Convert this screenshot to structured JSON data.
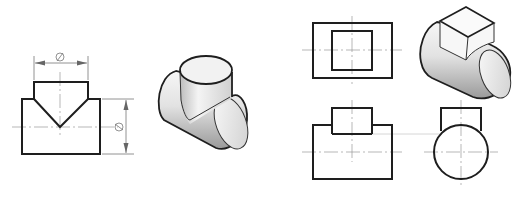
{
  "figure": {
    "left_group": {
      "front_view": {
        "dimension_horizontal_label": "Ø",
        "dimension_vertical_label": "Ø"
      },
      "isometric_view": {
        "subject": "equal-diameter cylinder tee"
      }
    },
    "right_group": {
      "top_view": {
        "subject": "rectangle with inner square"
      },
      "isometric_view": {
        "subject": "horizontal cylinder with square prism on top"
      },
      "front_view": {
        "subject": "rectangle with smaller rectangle on top"
      },
      "side_view": {
        "subject": "circle with rectangle on top"
      }
    },
    "colors": {
      "line": "#1e1e1e",
      "center_line": "#9a9a9a",
      "shade_light": "#f4f4f4",
      "shade_dark": "#9c9c9c"
    }
  }
}
